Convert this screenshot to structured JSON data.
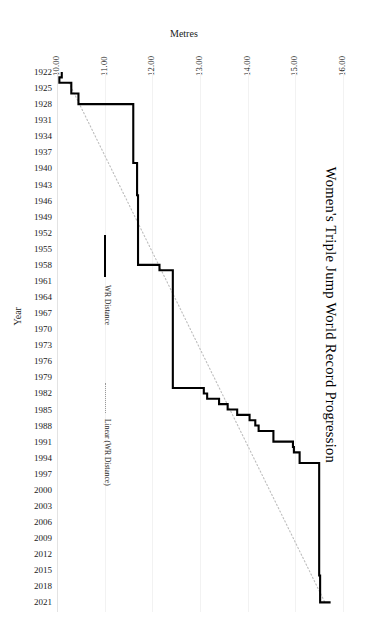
{
  "chart_data": {
    "type": "line",
    "title": "Women's Triple Jump World Record Progression",
    "xlabel": "Metres",
    "ylabel": "Year",
    "orientation": "horizontal-value-vertical-time",
    "grid": true,
    "legend_position": "inside-left",
    "xlim": [
      10.0,
      16.0
    ],
    "ylim": [
      1922,
      2021
    ],
    "xticks": [
      "10.00",
      "11.00",
      "12.00",
      "13.00",
      "14.00",
      "15.00",
      "16.00"
    ],
    "xtick_values": [
      10,
      11,
      12,
      13,
      14,
      15,
      16
    ],
    "yticks": [
      "1922",
      "1925",
      "1928",
      "1931",
      "1934",
      "1937",
      "1940",
      "1943",
      "1946",
      "1949",
      "1952",
      "1955",
      "1958",
      "1961",
      "1964",
      "1967",
      "1970",
      "1973",
      "1976",
      "1979",
      "1982",
      "1985",
      "1988",
      "1991",
      "1994",
      "1997",
      "2000",
      "2003",
      "2006",
      "2009",
      "2012",
      "2015",
      "2018",
      "2021"
    ],
    "ytick_values": [
      1922,
      1925,
      1928,
      1931,
      1934,
      1937,
      1940,
      1943,
      1946,
      1949,
      1952,
      1955,
      1958,
      1961,
      1964,
      1967,
      1970,
      1973,
      1976,
      1979,
      1982,
      1985,
      1988,
      1991,
      1994,
      1997,
      2000,
      2003,
      2006,
      2009,
      2012,
      2015,
      2018,
      2021
    ],
    "series": [
      {
        "name": "WR Distance",
        "style": "solid",
        "color": "#000000",
        "step": true,
        "points": [
          {
            "year": 1922,
            "metres": 10.1
          },
          {
            "year": 1923,
            "metres": 10.05
          },
          {
            "year": 1924,
            "metres": 10.3
          },
          {
            "year": 1926,
            "metres": 10.45
          },
          {
            "year": 1927,
            "metres": 10.45
          },
          {
            "year": 1928,
            "metres": 11.6
          },
          {
            "year": 1939,
            "metres": 11.6
          },
          {
            "year": 1939,
            "metres": 11.68
          },
          {
            "year": 1945,
            "metres": 11.7
          },
          {
            "year": 1958,
            "metres": 11.72
          },
          {
            "year": 1958,
            "metres": 12.15
          },
          {
            "year": 1959,
            "metres": 12.43
          },
          {
            "year": 1980,
            "metres": 12.43
          },
          {
            "year": 1981,
            "metres": 13.08
          },
          {
            "year": 1982,
            "metres": 13.15
          },
          {
            "year": 1983,
            "metres": 13.4
          },
          {
            "year": 1984,
            "metres": 13.58
          },
          {
            "year": 1985,
            "metres": 13.78
          },
          {
            "year": 1986,
            "metres": 14.04
          },
          {
            "year": 1987,
            "metres": 14.16
          },
          {
            "year": 1988,
            "metres": 14.23
          },
          {
            "year": 1989,
            "metres": 14.54
          },
          {
            "year": 1990,
            "metres": 14.54
          },
          {
            "year": 1991,
            "metres": 14.95
          },
          {
            "year": 1992,
            "metres": 14.97
          },
          {
            "year": 1993,
            "metres": 15.09
          },
          {
            "year": 1994,
            "metres": 15.09
          },
          {
            "year": 1995,
            "metres": 15.5
          },
          {
            "year": 2014,
            "metres": 15.5
          },
          {
            "year": 2016,
            "metres": 15.52
          },
          {
            "year": 2021,
            "metres": 15.74
          }
        ]
      },
      {
        "name": "Linear (WR Distance)",
        "style": "dotted",
        "color": "#bdbdbd",
        "trendline": true,
        "points": [
          {
            "year": 1924,
            "metres": 10.25
          },
          {
            "year": 2021,
            "metres": 15.62
          }
        ]
      }
    ]
  },
  "legend": {
    "items": [
      {
        "label": "WR Distance",
        "style": "solid"
      },
      {
        "label": "Linear (WR Distance)",
        "style": "dotted"
      }
    ]
  }
}
